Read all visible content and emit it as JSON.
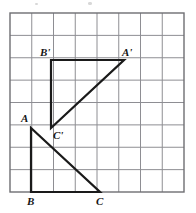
{
  "figure": {
    "grid": {
      "left": 10,
      "top": 13,
      "right": 184,
      "bottom": 192,
      "columns": 8,
      "rows": 8,
      "line_color": "#8e8e93",
      "border_color": "#6e6e72",
      "line_width": 1,
      "border_width": 1.4,
      "background": "#ffffff"
    },
    "shape_style": {
      "stroke_color": "#1a1a1a",
      "stroke_width": 2.2
    },
    "triangles": [
      {
        "name": "triangle-abc",
        "points": "31,128 31,192 100,192",
        "vertices": [
          {
            "id": "A",
            "label": "A",
            "x": 31,
            "y": 128
          },
          {
            "id": "B",
            "label": "B",
            "x": 31,
            "y": 192
          },
          {
            "id": "C",
            "label": "C",
            "x": 100,
            "y": 192
          }
        ]
      },
      {
        "name": "triangle-a-prime-b-prime-c-prime",
        "points": "51,60 124,60 51,128",
        "vertices": [
          {
            "id": "Aprime",
            "label": "A'",
            "x": 124,
            "y": 60
          },
          {
            "id": "Bprime",
            "label": "B'",
            "x": 51,
            "y": 60
          },
          {
            "id": "Cprime",
            "label": "C'",
            "x": 51,
            "y": 128
          }
        ]
      }
    ],
    "labels": [
      {
        "name": "vertex-label-b-prime",
        "text": "B'",
        "left": 40,
        "top": 47
      },
      {
        "name": "vertex-label-a-prime",
        "text": "A'",
        "left": 122,
        "top": 47
      },
      {
        "name": "vertex-label-c-prime",
        "text": "C'",
        "left": 53,
        "top": 130
      },
      {
        "name": "vertex-label-a",
        "text": "A",
        "left": 21,
        "top": 113
      },
      {
        "name": "vertex-label-b",
        "text": "B",
        "left": 27,
        "top": 196
      },
      {
        "name": "vertex-label-c",
        "text": "C",
        "left": 96,
        "top": 196
      }
    ],
    "artifacts": [
      {
        "name": "scan-speck-left",
        "left": 35,
        "top": 3,
        "width": 3,
        "height": 2
      },
      {
        "name": "scan-speck-center",
        "left": 88,
        "top": 2,
        "width": 4,
        "height": 3
      }
    ]
  }
}
